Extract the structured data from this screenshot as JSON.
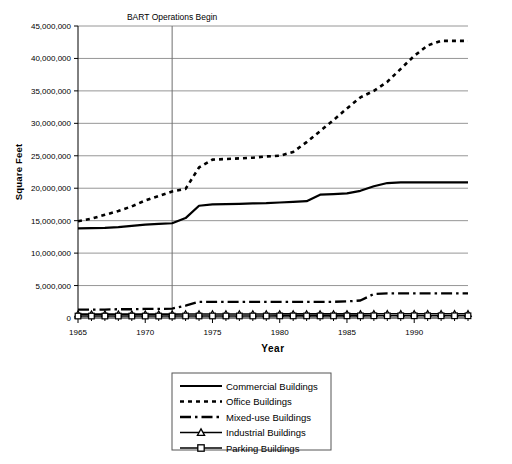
{
  "chart_data": {
    "type": "line",
    "title": "",
    "xlabel": "Year",
    "ylabel": "Square Feet",
    "xlim": [
      1965,
      1994
    ],
    "ylim": [
      0,
      45000000
    ],
    "ytick_labels": [
      "0",
      "5,000,000",
      "10,000,000",
      "15,000,000",
      "20,000,000",
      "25,000,000",
      "30,000,000",
      "35,000,000",
      "40,000,000",
      "45,000,000"
    ],
    "ytick_values": [
      0,
      5000000,
      10000000,
      15000000,
      20000000,
      25000000,
      30000000,
      35000000,
      40000000,
      45000000
    ],
    "xtick_labels": [
      "1965",
      "1970",
      "1975",
      "1980",
      "1985",
      "1990"
    ],
    "xtick_values": [
      1965,
      1970,
      1975,
      1980,
      1985,
      1990
    ],
    "grid": "horizontal",
    "legend_position": "below-center",
    "annotations": [
      {
        "label": "BART Operations Begin",
        "x": 1972,
        "type": "vertical-line"
      }
    ],
    "x": [
      1965,
      1966,
      1967,
      1968,
      1969,
      1970,
      1971,
      1972,
      1973,
      1974,
      1975,
      1976,
      1977,
      1978,
      1979,
      1980,
      1981,
      1982,
      1983,
      1984,
      1985,
      1986,
      1987,
      1988,
      1989,
      1990,
      1991,
      1992,
      1993,
      1994
    ],
    "series": [
      {
        "name": "Commercial Buildings",
        "style": "solid",
        "values": [
          13800000,
          13850000,
          13900000,
          14000000,
          14200000,
          14400000,
          14500000,
          14600000,
          15400000,
          17300000,
          17500000,
          17550000,
          17600000,
          17650000,
          17700000,
          17800000,
          17900000,
          18000000,
          19000000,
          19100000,
          19200000,
          19600000,
          20300000,
          20800000,
          20900000,
          20900000,
          20900000,
          20900000,
          20900000,
          20900000
        ]
      },
      {
        "name": "Office Buildings",
        "style": "dotted",
        "values": [
          14900000,
          15300000,
          15900000,
          16500000,
          17200000,
          18100000,
          18800000,
          19500000,
          19900000,
          23200000,
          24400000,
          24500000,
          24600000,
          24700000,
          24900000,
          25000000,
          25600000,
          27100000,
          28800000,
          30500000,
          32300000,
          34000000,
          35000000,
          36400000,
          38400000,
          40400000,
          42000000,
          42700000,
          42700000,
          42700000
        ]
      },
      {
        "name": "Mixed-use Buildings",
        "style": "dashdot",
        "values": [
          1300000,
          1300000,
          1300000,
          1350000,
          1350000,
          1400000,
          1400000,
          1450000,
          1900000,
          2500000,
          2500000,
          2500000,
          2500000,
          2500000,
          2500000,
          2500000,
          2500000,
          2500000,
          2500000,
          2500000,
          2550000,
          2700000,
          3700000,
          3800000,
          3800000,
          3800000,
          3800000,
          3800000,
          3800000,
          3800000
        ]
      },
      {
        "name": "Industrial Buildings",
        "style": "solid-triangle",
        "values": [
          600000,
          600000,
          600000,
          600000,
          600000,
          600000,
          600000,
          600000,
          620000,
          620000,
          620000,
          620000,
          620000,
          620000,
          620000,
          630000,
          630000,
          630000,
          630000,
          630000,
          640000,
          640000,
          650000,
          650000,
          650000,
          650000,
          650000,
          650000,
          650000,
          650000
        ]
      },
      {
        "name": "Parking Buildings",
        "style": "solid-square",
        "values": [
          300000,
          300000,
          300000,
          300000,
          300000,
          300000,
          300000,
          300000,
          310000,
          310000,
          310000,
          310000,
          310000,
          310000,
          310000,
          320000,
          320000,
          320000,
          320000,
          320000,
          330000,
          330000,
          340000,
          340000,
          340000,
          340000,
          340000,
          340000,
          340000,
          340000
        ]
      }
    ]
  },
  "legend": {
    "items": [
      {
        "label": "Commercial Buildings",
        "marker": "solid-line-swatch"
      },
      {
        "label": "Office Buildings",
        "marker": "dotted-line-swatch"
      },
      {
        "label": "Mixed-use Buildings",
        "marker": "dashdot-line-swatch"
      },
      {
        "label": "Industrial Buildings",
        "marker": "triangle-line-swatch"
      },
      {
        "label": "Parking Buildings",
        "marker": "square-line-swatch"
      }
    ]
  },
  "annotation": {
    "bart_label": "BART Operations Begin"
  },
  "axes": {
    "x_title": "Year",
    "y_title": "Square Feet"
  },
  "colors": {
    "ink": "#000000",
    "grid": "#8a8a8a",
    "background": "#ffffff"
  }
}
